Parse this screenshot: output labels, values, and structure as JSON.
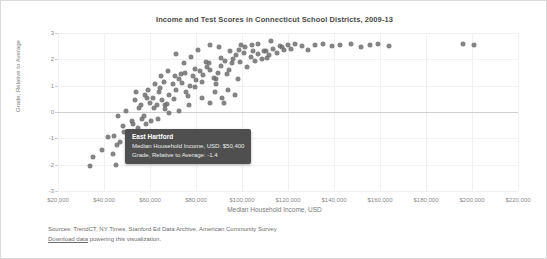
{
  "chart_data": {
    "type": "scatter",
    "title": "Income and Test Scores in Connecticut School Districts, 2009-13",
    "xlabel": "Median Household Income, USD",
    "ylabel": "Grade, Relative to Average",
    "xlim": [
      20000,
      220000
    ],
    "ylim": [
      -3,
      3
    ],
    "grid": true,
    "legend": "none",
    "xticks": [
      "$20,000",
      "$40,000",
      "$60,000",
      "$80,000",
      "$100,000",
      "$120,000",
      "$140,000",
      "$160,000",
      "$180,000",
      "$200,000",
      "$220,000"
    ],
    "xtickvalues": [
      20000,
      40000,
      60000,
      80000,
      100000,
      120000,
      140000,
      160000,
      180000,
      200000,
      220000
    ],
    "yticks": [
      "3",
      "2",
      "1",
      "0",
      "-1",
      "-2",
      "-3"
    ],
    "ytickvalues": [
      3,
      2,
      1,
      0,
      -1,
      -2,
      -3
    ],
    "point_color": "#6f6f6f",
    "points": [
      [
        35200,
        -1.7
      ],
      [
        39100,
        -1.45
      ],
      [
        41800,
        -0.95
      ],
      [
        44300,
        -0.9
      ],
      [
        45600,
        -1.25
      ],
      [
        43900,
        -1.6
      ],
      [
        46800,
        -1.15
      ],
      [
        45100,
        -2.0
      ],
      [
        33800,
        -2.05
      ],
      [
        50400,
        -1.4
      ],
      [
        48200,
        -0.55
      ],
      [
        52100,
        -0.35
      ],
      [
        54600,
        -0.6
      ],
      [
        51300,
        -0.8
      ],
      [
        56400,
        -0.25
      ],
      [
        58200,
        -0.45
      ],
      [
        55100,
        0.15
      ],
      [
        59800,
        0.35
      ],
      [
        57300,
        -0.15
      ],
      [
        61200,
        0.55
      ],
      [
        62900,
        0.25
      ],
      [
        60400,
        -0.35
      ],
      [
        63800,
        0.75
      ],
      [
        65100,
        0.45
      ],
      [
        66700,
        0.1
      ],
      [
        64200,
        0.9
      ],
      [
        68300,
        0.65
      ],
      [
        69900,
        1.05
      ],
      [
        67500,
        0.3
      ],
      [
        71200,
        0.85
      ],
      [
        72800,
        1.25
      ],
      [
        70400,
        0.5
      ],
      [
        74100,
        1.1
      ],
      [
        75600,
        0.75
      ],
      [
        73300,
        1.45
      ],
      [
        77200,
        1.0
      ],
      [
        78800,
        1.35
      ],
      [
        76500,
        0.6
      ],
      [
        80100,
        1.2
      ],
      [
        81700,
        1.55
      ],
      [
        79400,
        0.95
      ],
      [
        83200,
        1.4
      ],
      [
        84800,
        1.7
      ],
      [
        82500,
        1.15
      ],
      [
        86300,
        1.6
      ],
      [
        87900,
        1.3
      ],
      [
        85600,
        1.85
      ],
      [
        89400,
        1.5
      ],
      [
        91000,
        1.75
      ],
      [
        88700,
        1.25
      ],
      [
        92600,
        1.95
      ],
      [
        94200,
        1.6
      ],
      [
        90800,
        2.05
      ],
      [
        95800,
        1.85
      ],
      [
        97400,
        2.15
      ],
      [
        93500,
        1.45
      ],
      [
        99100,
        1.9
      ],
      [
        100700,
        2.25
      ],
      [
        96200,
        2.0
      ],
      [
        102300,
        1.7
      ],
      [
        103900,
        2.1
      ],
      [
        98600,
        2.35
      ],
      [
        105500,
        1.95
      ],
      [
        107100,
        2.2
      ],
      [
        101400,
        2.45
      ],
      [
        108700,
        2.0
      ],
      [
        110300,
        2.3
      ],
      [
        104200,
        2.55
      ],
      [
        111900,
        2.15
      ],
      [
        113500,
        2.4
      ],
      [
        106800,
        2.6
      ],
      [
        115100,
        2.25
      ],
      [
        116700,
        2.5
      ],
      [
        109500,
        2.3
      ],
      [
        118300,
        2.35
      ],
      [
        119900,
        2.55
      ],
      [
        112600,
        2.7
      ],
      [
        121500,
        2.4
      ],
      [
        123100,
        2.6
      ],
      [
        117400,
        2.45
      ],
      [
        126200,
        2.5
      ],
      [
        131800,
        2.55
      ],
      [
        128500,
        2.35
      ],
      [
        135400,
        2.6
      ],
      [
        139100,
        2.5
      ],
      [
        142700,
        2.55
      ],
      [
        147300,
        2.6
      ],
      [
        151900,
        2.45
      ],
      [
        155500,
        2.55
      ],
      [
        159100,
        2.6
      ],
      [
        163700,
        2.5
      ],
      [
        196200,
        2.6
      ],
      [
        200800,
        2.55
      ],
      [
        46200,
        -0.15
      ],
      [
        49700,
        0.05
      ],
      [
        53400,
        0.45
      ],
      [
        57800,
        0.65
      ],
      [
        61900,
        0.15
      ],
      [
        66100,
        1.15
      ],
      [
        70900,
        1.35
      ],
      [
        75200,
        1.5
      ],
      [
        79700,
        1.65
      ],
      [
        84400,
        1.9
      ],
      [
        88900,
        1.05
      ],
      [
        93700,
        0.85
      ],
      [
        98300,
        1.25
      ],
      [
        86100,
        0.35
      ],
      [
        91500,
        0.55
      ],
      [
        72400,
        0.05
      ],
      [
        68100,
        -0.05
      ],
      [
        63500,
        -0.25
      ],
      [
        59300,
        0.85
      ],
      [
        55900,
        0.25
      ],
      [
        52700,
        -0.45
      ],
      [
        48900,
        -0.75
      ],
      [
        81000,
        2.35
      ],
      [
        77800,
        2.1
      ],
      [
        74600,
        1.85
      ],
      [
        71500,
        2.2
      ],
      [
        67800,
        1.55
      ],
      [
        64900,
        1.35
      ],
      [
        85900,
        2.55
      ],
      [
        90200,
        2.45
      ],
      [
        94900,
        2.3
      ],
      [
        99700,
        2.55
      ],
      [
        104800,
        2.3
      ],
      [
        110900,
        2.05
      ],
      [
        76900,
        0.25
      ],
      [
        82800,
        0.55
      ],
      [
        88200,
        0.75
      ],
      [
        92100,
        0.35
      ],
      [
        96900,
        0.65
      ],
      [
        62200,
        1.05
      ],
      [
        58700,
        0.55
      ],
      [
        66400,
        0.25
      ],
      [
        54100,
        0.75
      ]
    ],
    "highlighted_point": {
      "name": "East Hartford",
      "income": 50400,
      "grade": -1.4
    }
  },
  "tooltip": {
    "title": "East Hartford",
    "rows": [
      "Median Household Income, USD: $50,400",
      "Grade, Relative to Average: -1.4"
    ]
  },
  "footer": {
    "sources": "Sources: TrendCT, NY Times, Stanford Ed Data Archive, American Community Survey",
    "download_link_text": "Download data",
    "download_rest": " powering this visualization."
  }
}
